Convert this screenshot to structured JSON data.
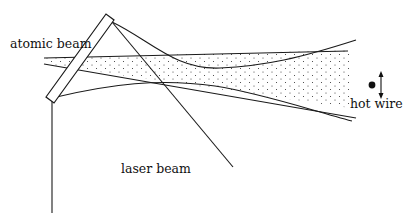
{
  "diagram": {
    "labels": {
      "atomic_beam": "atomic beam",
      "laser_beam": "laser beam",
      "hot_wire": "hot wire"
    },
    "elements": [
      {
        "name": "mirror",
        "shape": "slanted rectangle"
      },
      {
        "name": "atomic-beam",
        "shape": "dotted wedge, diverging left to right"
      },
      {
        "name": "laser-beam",
        "shape": "line from mirror top downward right"
      },
      {
        "name": "incident-laser",
        "shape": "vertical line below mirror"
      },
      {
        "name": "deflected-trajectories",
        "shape": "curves crossing the beam"
      },
      {
        "name": "hot-wire-detector",
        "shape": "dot with vertical double arrow"
      }
    ],
    "colors": {
      "line": "#1a1a1a",
      "background": "#ffffff"
    }
  }
}
